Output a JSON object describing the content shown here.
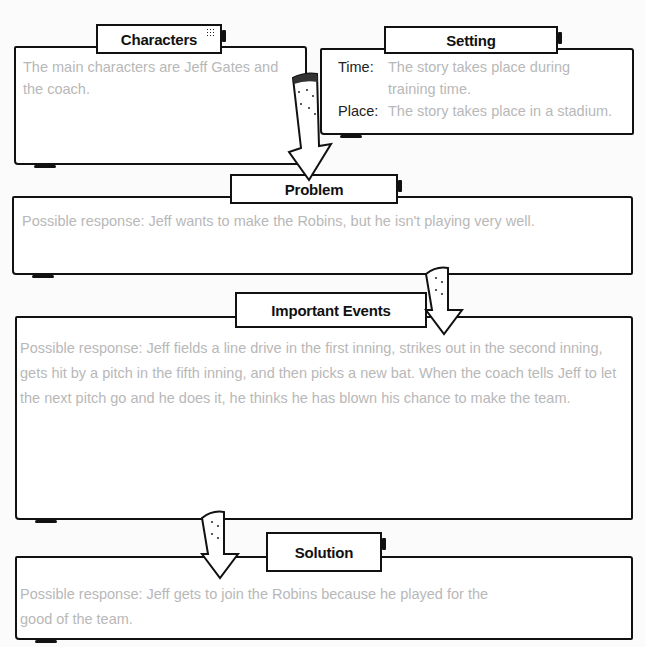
{
  "characters": {
    "label": "Characters",
    "text": "The main characters are Jeff Gates and the coach."
  },
  "setting": {
    "label": "Setting",
    "time_key": "Time:",
    "time_value": "The story takes place during training time.",
    "place_key": "Place:",
    "place_value": "The story takes place in a stadium."
  },
  "problem": {
    "label": "Problem",
    "text": "Possible response: Jeff wants to make the Robins, but he isn't playing very well."
  },
  "important_events": {
    "label": "Important Events",
    "text": "Possible response: Jeff fields a line drive in the first inning, strikes out in the second inning, gets hit by a pitch in the fifth inning, and then picks a new bat. When the coach tells Jeff to let the next pitch go and he does it, he thinks he has blown his chance to make the team."
  },
  "solution": {
    "label": "Solution",
    "text": "Possible response: Jeff gets to join the Robins because he played for the good of the team."
  },
  "colors": {
    "ink": "#111111",
    "answer_text": "#b8b8b8",
    "background": "#ffffff"
  },
  "icons": [
    "down-arrow-icon",
    "down-arrow-icon",
    "down-arrow-icon"
  ]
}
